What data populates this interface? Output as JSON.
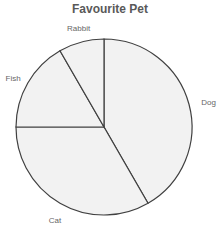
{
  "chart_data": {
    "type": "pie",
    "title": "Favourite Pet",
    "categories": [
      "Dog",
      "Cat",
      "Fish",
      "Rabbit"
    ],
    "values": [
      5,
      4,
      2,
      1
    ],
    "percentages": [
      41.7,
      33.3,
      16.7,
      8.3
    ],
    "start_angle_deg": 0,
    "direction": "clockwise",
    "fill_color": "#f2f2f2",
    "stroke_color": "#404040",
    "legend": "none",
    "labels_position": "outside"
  }
}
